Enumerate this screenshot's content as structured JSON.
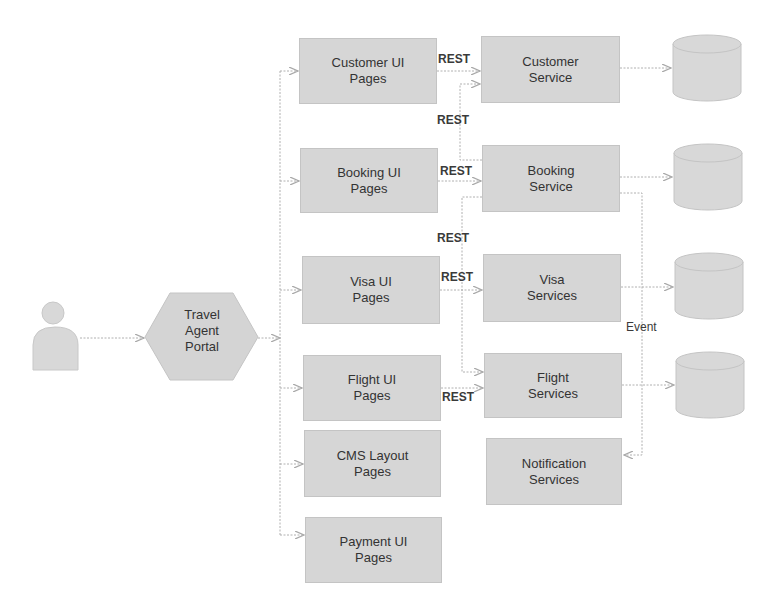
{
  "actor": {
    "name": "user"
  },
  "portal": {
    "label": "Travel\nAgent\nPortal"
  },
  "ui_pages": [
    {
      "id": "customer-ui",
      "label": "Customer UI\nPages"
    },
    {
      "id": "booking-ui",
      "label": "Booking UI\nPages"
    },
    {
      "id": "visa-ui",
      "label": "Visa UI\nPages"
    },
    {
      "id": "flight-ui",
      "label": "Flight UI\nPages"
    },
    {
      "id": "cms-layout",
      "label": "CMS Layout\nPages"
    },
    {
      "id": "payment-ui",
      "label": "Payment UI\nPages"
    }
  ],
  "services": [
    {
      "id": "customer-service",
      "label": "Customer\nService"
    },
    {
      "id": "booking-service",
      "label": "Booking\nService"
    },
    {
      "id": "visa-services",
      "label": "Visa\nServices"
    },
    {
      "id": "flight-services",
      "label": "Flight\nServices"
    },
    {
      "id": "notification-services",
      "label": "Notification\nServices"
    }
  ],
  "edge_labels": {
    "rest_customer": "REST",
    "rest_booking_to_customer": "REST",
    "rest_booking": "REST",
    "rest_booking_to_flight": "REST",
    "rest_visa": "REST",
    "rest_flight": "REST",
    "event": "Event"
  },
  "databases": [
    {
      "id": "customer-db"
    },
    {
      "id": "booking-db"
    },
    {
      "id": "visa-db"
    },
    {
      "id": "flight-db"
    }
  ]
}
